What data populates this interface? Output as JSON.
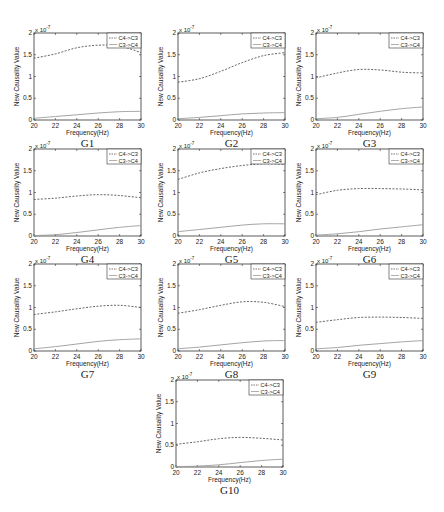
{
  "figure": {
    "panel_count": 10,
    "colors": {
      "axis": "#333333",
      "series_c4_c3": "#555555",
      "series_c3_c4": "#9a9a9a",
      "background": "#ffffff"
    }
  },
  "chart_data": [
    {
      "type": "line",
      "title": "G1",
      "xlabel": "Frequency(Hz)",
      "ylabel": "New Causality Value",
      "y_exponent": "x 10^-7",
      "xlim": [
        20,
        30
      ],
      "ylim": [
        0,
        2
      ],
      "xticks": [
        20,
        22,
        24,
        26,
        28,
        30
      ],
      "yticks": [
        0,
        0.5,
        1,
        1.5,
        2
      ],
      "x": [
        20,
        22,
        24,
        26,
        28,
        30
      ],
      "legend": [
        "C4->C3",
        "C3->C4"
      ],
      "legend_position": "upper right",
      "series": [
        {
          "name": "C4->C3",
          "style": "dashed",
          "values": [
            1.42,
            1.52,
            1.66,
            1.72,
            1.7,
            1.55
          ]
        },
        {
          "name": "C3->C4",
          "style": "solid",
          "values": [
            0.04,
            0.08,
            0.12,
            0.16,
            0.19,
            0.2
          ]
        }
      ]
    },
    {
      "type": "line",
      "title": "G2",
      "xlabel": "Frequency(Hz)",
      "ylabel": "New Causality Value",
      "y_exponent": "x 10^-7",
      "xlim": [
        20,
        30
      ],
      "ylim": [
        0,
        2
      ],
      "xticks": [
        20,
        22,
        24,
        26,
        28,
        30
      ],
      "yticks": [
        0,
        0.5,
        1,
        1.5,
        2
      ],
      "x": [
        20,
        22,
        24,
        26,
        28,
        30
      ],
      "legend": [
        "C4->C3",
        "C3->C4"
      ],
      "legend_position": "upper right",
      "series": [
        {
          "name": "C4->C3",
          "style": "dashed",
          "values": [
            0.87,
            0.95,
            1.12,
            1.32,
            1.48,
            1.55
          ]
        },
        {
          "name": "C3->C4",
          "style": "solid",
          "values": [
            0.03,
            0.06,
            0.1,
            0.14,
            0.16,
            0.17
          ]
        }
      ]
    },
    {
      "type": "line",
      "title": "G3",
      "xlabel": "Frequency(Hz)",
      "ylabel": "New Causality Value",
      "y_exponent": "x 10^-7",
      "xlim": [
        20,
        30
      ],
      "ylim": [
        0,
        2
      ],
      "xticks": [
        20,
        22,
        24,
        26,
        28,
        30
      ],
      "yticks": [
        0,
        0.5,
        1,
        1.5,
        2
      ],
      "x": [
        20,
        22,
        24,
        26,
        28,
        30
      ],
      "legend": [
        "C4->C3",
        "C3->C4"
      ],
      "legend_position": "upper right",
      "series": [
        {
          "name": "C4->C3",
          "style": "dashed",
          "values": [
            0.97,
            1.08,
            1.16,
            1.15,
            1.1,
            1.08
          ]
        },
        {
          "name": "C3->C4",
          "style": "solid",
          "values": [
            0.03,
            0.06,
            0.13,
            0.2,
            0.26,
            0.3
          ]
        }
      ]
    },
    {
      "type": "line",
      "title": "G4",
      "xlabel": "Frequency(Hz)",
      "ylabel": "New Causality Value",
      "y_exponent": "x 10^-7",
      "xlim": [
        20,
        30
      ],
      "ylim": [
        0,
        2
      ],
      "xticks": [
        20,
        22,
        24,
        26,
        28,
        30
      ],
      "yticks": [
        0,
        0.5,
        1,
        1.5,
        2
      ],
      "x": [
        20,
        22,
        24,
        26,
        28,
        30
      ],
      "legend": [
        "C4->C3",
        "C3->C4"
      ],
      "legend_position": "upper right",
      "series": [
        {
          "name": "C4->C3",
          "style": "dashed",
          "values": [
            0.84,
            0.87,
            0.92,
            0.95,
            0.93,
            0.88
          ]
        },
        {
          "name": "C3->C4",
          "style": "solid",
          "values": [
            0.01,
            0.03,
            0.08,
            0.14,
            0.2,
            0.24
          ]
        }
      ]
    },
    {
      "type": "line",
      "title": "G5",
      "xlabel": "Frequency(Hz)",
      "ylabel": "New Causality Value",
      "y_exponent": "x 10^-7",
      "xlim": [
        20,
        30
      ],
      "ylim": [
        0,
        2
      ],
      "xticks": [
        20,
        22,
        24,
        26,
        28,
        30
      ],
      "yticks": [
        0,
        0.5,
        1,
        1.5,
        2
      ],
      "x": [
        20,
        22,
        24,
        26,
        28,
        30
      ],
      "legend": [
        "C4->C3",
        "C3->C4"
      ],
      "legend_position": "upper right",
      "series": [
        {
          "name": "C4->C3",
          "style": "dashed",
          "values": [
            1.3,
            1.45,
            1.55,
            1.62,
            1.66,
            1.65
          ]
        },
        {
          "name": "C3->C4",
          "style": "solid",
          "values": [
            0.1,
            0.15,
            0.2,
            0.25,
            0.28,
            0.28
          ]
        }
      ]
    },
    {
      "type": "line",
      "title": "G6",
      "xlabel": "Frequency(Hz)",
      "ylabel": "New Causality Value",
      "y_exponent": "x 10^-7",
      "xlim": [
        20,
        30
      ],
      "ylim": [
        0,
        2
      ],
      "xticks": [
        20,
        22,
        24,
        26,
        28,
        30
      ],
      "yticks": [
        0,
        0.5,
        1,
        1.5,
        2
      ],
      "x": [
        20,
        22,
        24,
        26,
        28,
        30
      ],
      "legend": [
        "C4->C3",
        "C3->C4"
      ],
      "legend_position": "upper right",
      "series": [
        {
          "name": "C4->C3",
          "style": "dashed",
          "values": [
            0.95,
            1.05,
            1.09,
            1.09,
            1.08,
            1.06
          ]
        },
        {
          "name": "C3->C4",
          "style": "solid",
          "values": [
            0.02,
            0.05,
            0.1,
            0.16,
            0.21,
            0.26
          ]
        }
      ]
    },
    {
      "type": "line",
      "title": "G7",
      "xlabel": "Frequency(Hz)",
      "ylabel": "New Causality Value",
      "y_exponent": "x 10^-7",
      "xlim": [
        20,
        30
      ],
      "ylim": [
        0,
        2
      ],
      "xticks": [
        20,
        22,
        24,
        26,
        28,
        30
      ],
      "yticks": [
        0,
        0.5,
        1,
        1.5,
        2
      ],
      "x": [
        20,
        22,
        24,
        26,
        28,
        30
      ],
      "legend": [
        "C4->C3",
        "C3->C4"
      ],
      "legend_position": "upper right",
      "series": [
        {
          "name": "C4->C3",
          "style": "dashed",
          "values": [
            0.84,
            0.9,
            0.97,
            1.03,
            1.05,
            1.0
          ]
        },
        {
          "name": "C3->C4",
          "style": "solid",
          "values": [
            0.05,
            0.1,
            0.16,
            0.22,
            0.26,
            0.28
          ]
        }
      ]
    },
    {
      "type": "line",
      "title": "G8",
      "xlabel": "Frequency(Hz)",
      "ylabel": "New Causality Value",
      "y_exponent": "x 10^-7",
      "xlim": [
        20,
        30
      ],
      "ylim": [
        0,
        2
      ],
      "xticks": [
        20,
        22,
        24,
        26,
        28,
        30
      ],
      "yticks": [
        0,
        0.5,
        1,
        1.5,
        2
      ],
      "x": [
        20,
        22,
        24,
        26,
        28,
        30
      ],
      "legend": [
        "C4->C3",
        "C3->C4"
      ],
      "legend_position": "upper right",
      "series": [
        {
          "name": "C4->C3",
          "style": "dashed",
          "values": [
            0.87,
            0.95,
            1.05,
            1.13,
            1.12,
            1.02
          ]
        },
        {
          "name": "C3->C4",
          "style": "solid",
          "values": [
            0.05,
            0.09,
            0.14,
            0.19,
            0.23,
            0.24
          ]
        }
      ]
    },
    {
      "type": "line",
      "title": "G9",
      "xlabel": "Frequency(Hz)",
      "ylabel": "New Causality Value",
      "y_exponent": "x 10^-7",
      "xlim": [
        20,
        30
      ],
      "ylim": [
        0,
        2
      ],
      "xticks": [
        20,
        22,
        24,
        26,
        28,
        30
      ],
      "yticks": [
        0,
        0.5,
        1,
        1.5,
        2
      ],
      "x": [
        20,
        22,
        24,
        26,
        28,
        30
      ],
      "legend": [
        "C4->C3",
        "C3->C4"
      ],
      "legend_position": "upper right",
      "series": [
        {
          "name": "C4->C3",
          "style": "dashed",
          "values": [
            0.66,
            0.72,
            0.77,
            0.78,
            0.77,
            0.75
          ]
        },
        {
          "name": "C3->C4",
          "style": "solid",
          "values": [
            0.05,
            0.08,
            0.13,
            0.17,
            0.21,
            0.24
          ]
        }
      ]
    },
    {
      "type": "line",
      "title": "G10",
      "xlabel": "Frequency(Hz)",
      "ylabel": "New Causality Value",
      "y_exponent": "x 10^-7",
      "xlim": [
        20,
        30
      ],
      "ylim": [
        0,
        2
      ],
      "xticks": [
        20,
        22,
        24,
        26,
        28,
        30
      ],
      "yticks": [
        0,
        0.5,
        1,
        1.5,
        2
      ],
      "x": [
        20,
        22,
        24,
        26,
        28,
        30
      ],
      "legend": [
        "C4->C3",
        "C3->C4"
      ],
      "legend_position": "upper right",
      "series": [
        {
          "name": "C4->C3",
          "style": "dashed",
          "values": [
            0.52,
            0.58,
            0.65,
            0.68,
            0.66,
            0.62
          ]
        },
        {
          "name": "C3->C4",
          "style": "solid",
          "values": [
            0.01,
            0.02,
            0.05,
            0.1,
            0.15,
            0.18
          ]
        }
      ]
    }
  ],
  "layout": {
    "panels": [
      {
        "left": 34,
        "top": 33,
        "width": 107,
        "height": 87
      },
      {
        "left": 178,
        "top": 33,
        "width": 107,
        "height": 87
      },
      {
        "left": 316,
        "top": 33,
        "width": 107,
        "height": 87
      },
      {
        "left": 34,
        "top": 149,
        "width": 107,
        "height": 87
      },
      {
        "left": 178,
        "top": 149,
        "width": 107,
        "height": 87
      },
      {
        "left": 316,
        "top": 149,
        "width": 107,
        "height": 87
      },
      {
        "left": 34,
        "top": 264,
        "width": 107,
        "height": 87
      },
      {
        "left": 178,
        "top": 264,
        "width": 107,
        "height": 87
      },
      {
        "left": 316,
        "top": 264,
        "width": 107,
        "height": 87
      },
      {
        "left": 176,
        "top": 380,
        "width": 107,
        "height": 87
      }
    ]
  }
}
